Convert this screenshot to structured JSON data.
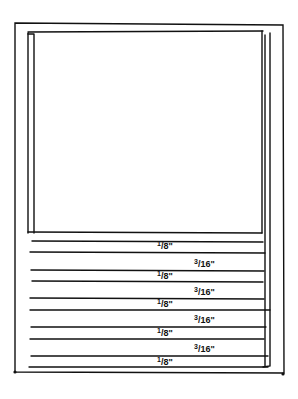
{
  "diagram": {
    "type": "sketch",
    "stroke_color": "#111111",
    "outer_frame": {
      "x": 15,
      "y": 23,
      "w": 268,
      "h": 350
    },
    "inner_panel": {
      "x": 28,
      "y": 31,
      "w": 242,
      "h": 202
    },
    "slat_lines_y": [
      232,
      241,
      252,
      270,
      281,
      298,
      310,
      327,
      339,
      356,
      367
    ],
    "labels": [
      {
        "num": "1",
        "den": "8",
        "unit": "\"",
        "text": "1/8\"",
        "x": 157,
        "y": 240
      },
      {
        "num": "3",
        "den": "16",
        "unit": "\"",
        "text": "3/16\"",
        "x": 194,
        "y": 258
      },
      {
        "num": "1",
        "den": "8",
        "unit": "\"",
        "text": "1/8\"",
        "x": 157,
        "y": 270
      },
      {
        "num": "3",
        "den": "16",
        "unit": "\"",
        "text": "3/16\"",
        "x": 194,
        "y": 286
      },
      {
        "num": "1",
        "den": "8",
        "unit": "\"",
        "text": "1/8\"",
        "x": 157,
        "y": 298
      },
      {
        "num": "3",
        "den": "16",
        "unit": "\"",
        "text": "3/16\"",
        "x": 194,
        "y": 314
      },
      {
        "num": "1",
        "den": "8",
        "unit": "\"",
        "text": "1/8\"",
        "x": 157,
        "y": 327
      },
      {
        "num": "3",
        "den": "16",
        "unit": "\"",
        "text": "3/16\"",
        "x": 194,
        "y": 343
      },
      {
        "num": "1",
        "den": "8",
        "unit": "\"",
        "text": "1/8\"",
        "x": 157,
        "y": 356
      }
    ]
  }
}
